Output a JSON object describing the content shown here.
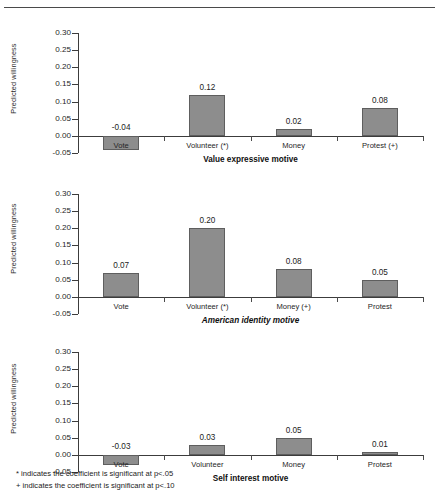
{
  "figure": {
    "y_axis_label": "Predicted willingness",
    "y_ticks": [
      "0.30",
      "0.25",
      "0.20",
      "0.15",
      "0.10",
      "0.05",
      "0.00",
      "-0.05"
    ],
    "bar_color": "#8d8d8d",
    "bar_border_color": "#5e5e5e",
    "axis_color": "#3c3c3c"
  },
  "footnotes": [
    "* indicates the coefficient is significant at p<.05",
    "+ indicates the coefficient is significant at p<.10"
  ],
  "chart_data": [
    {
      "type": "bar",
      "title": "Value expressive motive",
      "title_style": "bold",
      "xlabel": "Value expressive motive",
      "ylabel": "Predicted willingness",
      "categories": [
        "Vote",
        "Volunteer (*)",
        "Money",
        "Protest (+)"
      ],
      "values": [
        -0.04,
        0.12,
        0.02,
        0.08
      ],
      "labels": [
        "-0.04",
        "0.12",
        "0.02",
        "0.08"
      ],
      "ylim": [
        -0.05,
        0.3
      ],
      "ytick_step": 0.05,
      "grid": false,
      "legend": "none"
    },
    {
      "type": "bar",
      "title": "American identity motive",
      "title_style": "bold-italic",
      "xlabel": "American identity motive",
      "ylabel": "Predicted willingness",
      "categories": [
        "Vote",
        "Volunteer (*)",
        "Money (+)",
        "Protest"
      ],
      "values": [
        0.07,
        0.2,
        0.08,
        0.05
      ],
      "labels": [
        "0.07",
        "0.20",
        "0.08",
        "0.05"
      ],
      "ylim": [
        -0.05,
        0.3
      ],
      "ytick_step": 0.05,
      "grid": false,
      "legend": "none"
    },
    {
      "type": "bar",
      "title": "Self interest motive",
      "title_style": "bold",
      "xlabel": "Self interest motive",
      "ylabel": "Predicted willingness",
      "categories": [
        "Vote",
        "Volunteer",
        "Money",
        "Protest"
      ],
      "values": [
        -0.03,
        0.03,
        0.05,
        0.01
      ],
      "labels": [
        "-0.03",
        "0.03",
        "0.05",
        "0.01"
      ],
      "ylim": [
        -0.05,
        0.3
      ],
      "ytick_step": 0.05,
      "grid": false,
      "legend": "none"
    }
  ]
}
